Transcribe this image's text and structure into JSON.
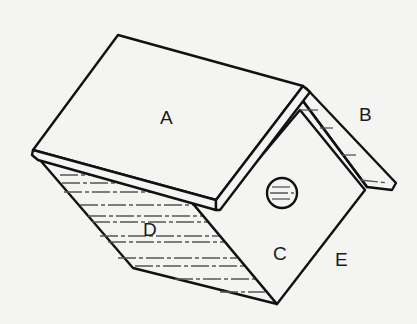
{
  "diagram": {
    "type": "birdhouse-isometric-parts",
    "labels": {
      "A": "A",
      "B": "B",
      "C": "C",
      "D": "D",
      "E": "E"
    },
    "parts": [
      {
        "label": "A",
        "description": "left roof panel (top)"
      },
      {
        "label": "B",
        "description": "right roof panel (edge visible)"
      },
      {
        "label": "C",
        "description": "front gable wall with entrance hole"
      },
      {
        "label": "D",
        "description": "left side wall (shaded)"
      },
      {
        "label": "E",
        "description": "right edge of front wall"
      }
    ],
    "colors": {
      "background": "#f4f4f2",
      "line": "#111111",
      "hatch": "#555555"
    }
  }
}
